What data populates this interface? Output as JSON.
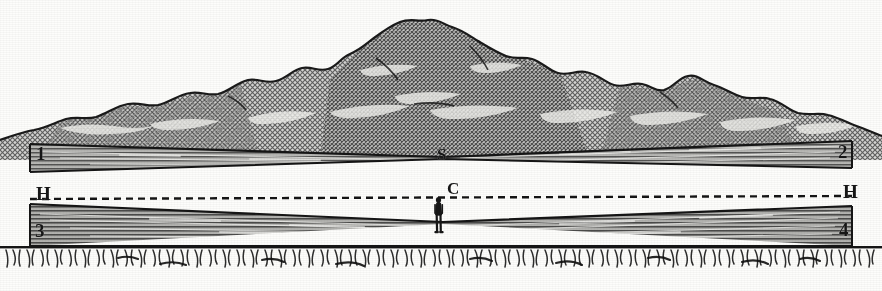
{
  "figure": {
    "medium": "engraving halftone",
    "width": 882,
    "height": 291,
    "background_color": "#fdfdfb",
    "ink_color": "#161616"
  },
  "labels": {
    "top_left": "1",
    "top_right": "2",
    "bottom_left": "3",
    "bottom_right": "4",
    "horizon_left": "H",
    "horizon_right": "H",
    "summit_point": "S",
    "center_point": "C"
  },
  "elements": {
    "mountain": "mountain-range",
    "upper_band": "upper-hatched-band",
    "lower_band": "lower-hatched-band",
    "horizon_line": "dashed-horizon-line",
    "observer": "standing-human-figure",
    "foreground": "grass-hatching"
  },
  "geometry": {
    "horizon_y": 196,
    "summit_x": 443,
    "center_x": 443,
    "observer_x": 437,
    "upper_band_left_top_y": 148,
    "upper_band_right_top_y": 141,
    "lower_band_left_bottom_y": 246,
    "lower_band_right_bottom_y": 246
  },
  "colors": {
    "paper": "#fdfdfb",
    "ink": "#161616",
    "band_fill": "#8d8d8d",
    "mountain_fill": "#9a9a9a",
    "mountain_dark": "#6e6e6e"
  }
}
